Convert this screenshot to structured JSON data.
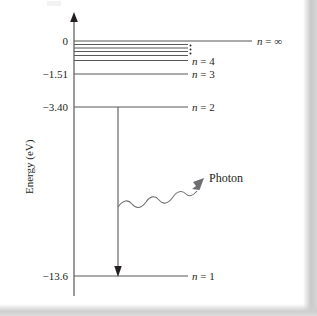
{
  "figure": {
    "type": "energy-level-diagram",
    "axis": {
      "y_label": "Energy (eV)",
      "y_unit": "eV",
      "arrow_direction": "up"
    },
    "tick_labels": [
      "0",
      "−1.51",
      "−3.40",
      "−13.6"
    ],
    "level_labels": {
      "n_infinity": "n = ∞",
      "n4": "n = 4",
      "n3": "n = 3",
      "n2": "n = 2",
      "n1": "n = 1"
    },
    "ellipsis": "⋮",
    "annotations": {
      "photon": "Photon"
    },
    "colors": {
      "ink": "#231f20",
      "line": "#58585b",
      "paper": "#ffffff",
      "edge_shadow": "#c9c9c9"
    }
  },
  "chart_data": {
    "type": "line",
    "title": "",
    "xlabel": "",
    "ylabel": "Energy (eV)",
    "ylim": [
      -13.6,
      0
    ],
    "grid": false,
    "legend": "none",
    "levels": [
      {
        "label": "n = ∞",
        "n": "infinity",
        "energy_ev": 0,
        "tick": "0",
        "line_start_x": 74,
        "line_end_x": 252,
        "y": 41
      },
      {
        "label": "",
        "n": 8,
        "energy_ev": -0.21,
        "tick": "",
        "line_start_x": 74,
        "line_end_x": 188,
        "y": 44
      },
      {
        "label": "",
        "n": 7,
        "energy_ev": -0.28,
        "tick": "",
        "line_start_x": 74,
        "line_end_x": 188,
        "y": 47
      },
      {
        "label": "",
        "n": 6,
        "energy_ev": -0.38,
        "tick": "",
        "line_start_x": 74,
        "line_end_x": 188,
        "y": 50
      },
      {
        "label": "",
        "n": 5,
        "energy_ev": -0.54,
        "tick": "",
        "line_start_x": 74,
        "line_end_x": 188,
        "y": 54
      },
      {
        "label": "n = 4",
        "n": 4,
        "energy_ev": -0.85,
        "tick": "",
        "line_start_x": 74,
        "line_end_x": 188,
        "y": 60
      },
      {
        "label": "n = 3",
        "n": 3,
        "energy_ev": -1.51,
        "tick": "−1.51",
        "line_start_x": 74,
        "line_end_x": 188,
        "y": 74
      },
      {
        "label": "n = 2",
        "n": 2,
        "energy_ev": -3.4,
        "tick": "−3.40",
        "line_start_x": 74,
        "line_end_x": 188,
        "y": 107
      },
      {
        "label": "n = 1",
        "n": 1,
        "energy_ev": -13.6,
        "tick": "−13.6",
        "line_start_x": 74,
        "line_end_x": 188,
        "y": 276
      }
    ],
    "transition": {
      "from_level": 2,
      "to_level": 1,
      "from_energy_ev": -3.4,
      "to_energy_ev": -13.6,
      "emitted": "Photon",
      "arrow_x": 118,
      "arrow_y_top": 107,
      "arrow_y_bottom": 276
    },
    "photon_wave": {
      "label": "Photon",
      "start_x": 118,
      "start_y": 207,
      "end_x": 205,
      "end_y": 176
    },
    "annotations": [
      "⋮"
    ]
  }
}
